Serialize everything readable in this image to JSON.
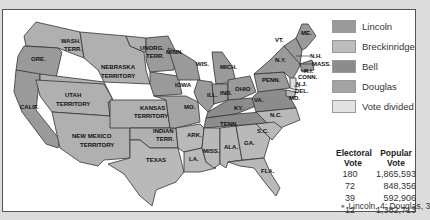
{
  "colors": {
    "lincoln": "#9a9a9a",
    "breckinridge": "#b9b9b9",
    "bell": "#8a8a8a",
    "douglas": "#a8a8a8",
    "vote_divided": "#dedede",
    "border": "#333333",
    "panel_bg": "#ffffff"
  },
  "legend": [
    {
      "label": "Lincoln",
      "color": "#9a9a9a"
    },
    {
      "label": "Breckinridge",
      "color": "#bcbcbc"
    },
    {
      "label": "Bell",
      "color": "#8c8c8c"
    },
    {
      "label": "Douglas",
      "color": "#a4a4a4"
    },
    {
      "label": "Vote divided",
      "color": "#e2e2e2"
    }
  ],
  "results": {
    "headers": {
      "electoral": "Electoral Vote",
      "popular": "Popular Vote"
    },
    "rows": [
      {
        "electoral": "180",
        "popular": "1,865,593"
      },
      {
        "electoral": "72",
        "popular": "848,356"
      },
      {
        "electoral": "39",
        "popular": "592,906"
      },
      {
        "electoral": "12",
        "popular": "1,382,713"
      }
    ],
    "footnote": "Lincoln, 4; Douglas, 3",
    "footnote_marker": "✴"
  },
  "map_labels": {
    "wash": "WASH.",
    "terr": "TERR.",
    "ore": "ORE.",
    "calif": "CALIF.",
    "nebraska": "NEBRASKA",
    "territory": "TERRITORY",
    "utah": "UTAH",
    "unorg": "UNORG.",
    "minn": "MINN.",
    "wis": "WIS.",
    "mich": "MICH.",
    "iowa": "IOWA",
    "ill": "ILL.",
    "ind": "IND.",
    "ohio": "OHIO",
    "kansas": "KANSAS",
    "mo": "MO.",
    "ky": "KY.",
    "new_mexico": "NEW MEXICO",
    "indian": "INDIAN",
    "ark": "ARK.",
    "tenn": "TENN.",
    "texas": "TEXAS",
    "la": "LA.",
    "miss": "MISS.",
    "ala": "ALA.",
    "ga": "GA.",
    "fla": "FLA.",
    "sc": "S.C.",
    "nc": "N.C.",
    "va": "VA.",
    "penn": "PENN.",
    "ny": "N.Y.",
    "vt": "VT.",
    "me": "ME.",
    "nh": "N.H.",
    "mass": "MASS.",
    "ri": "R.I.",
    "conn": "CONN.",
    "nj": "N.J.",
    "del": "DEL.",
    "md": "MD."
  }
}
